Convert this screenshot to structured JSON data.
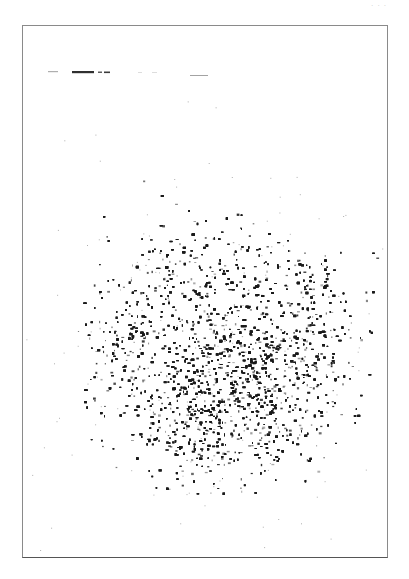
{
  "page": {
    "corner_label": "· · ·",
    "background": "#ffffff",
    "frame_color": "#8a8a8a"
  },
  "figure": {
    "type": "scintigraphy-scan",
    "ink_color": "#1a1a1a",
    "header_marks": [
      {
        "x": 48,
        "y": 71,
        "w": 10,
        "h": 1.2,
        "o": 0.35
      },
      {
        "x": 72,
        "y": 71,
        "w": 22,
        "h": 2.2,
        "o": 0.9
      },
      {
        "x": 98,
        "y": 71.5,
        "w": 4,
        "h": 1.5,
        "o": 0.7
      },
      {
        "x": 104,
        "y": 71.5,
        "w": 6,
        "h": 1.6,
        "o": 0.85
      },
      {
        "x": 138,
        "y": 72,
        "w": 4,
        "h": 1,
        "o": 0.15
      },
      {
        "x": 152,
        "y": 72,
        "w": 5,
        "h": 1,
        "o": 0.15
      },
      {
        "x": 190,
        "y": 75,
        "w": 18,
        "h": 1,
        "o": 0.4
      }
    ],
    "blob": {
      "center": [
        222,
        355
      ],
      "radius": [
        145,
        140
      ],
      "speck_count": 9000,
      "hotspots": [
        {
          "x": 160,
          "y": 250,
          "r": 38,
          "w": 1.0
        },
        {
          "x": 330,
          "y": 300,
          "r": 45,
          "w": 0.9
        },
        {
          "x": 275,
          "y": 375,
          "r": 55,
          "w": 1.0
        },
        {
          "x": 210,
          "y": 430,
          "r": 55,
          "w": 1.0
        },
        {
          "x": 120,
          "y": 330,
          "r": 40,
          "w": 0.6
        },
        {
          "x": 250,
          "y": 250,
          "r": 40,
          "w": 0.55
        }
      ],
      "coldspots": [
        {
          "x": 235,
          "y": 300,
          "r": 40,
          "w": 0.6
        },
        {
          "x": 175,
          "y": 365,
          "r": 30,
          "w": 0.45
        }
      ]
    }
  }
}
